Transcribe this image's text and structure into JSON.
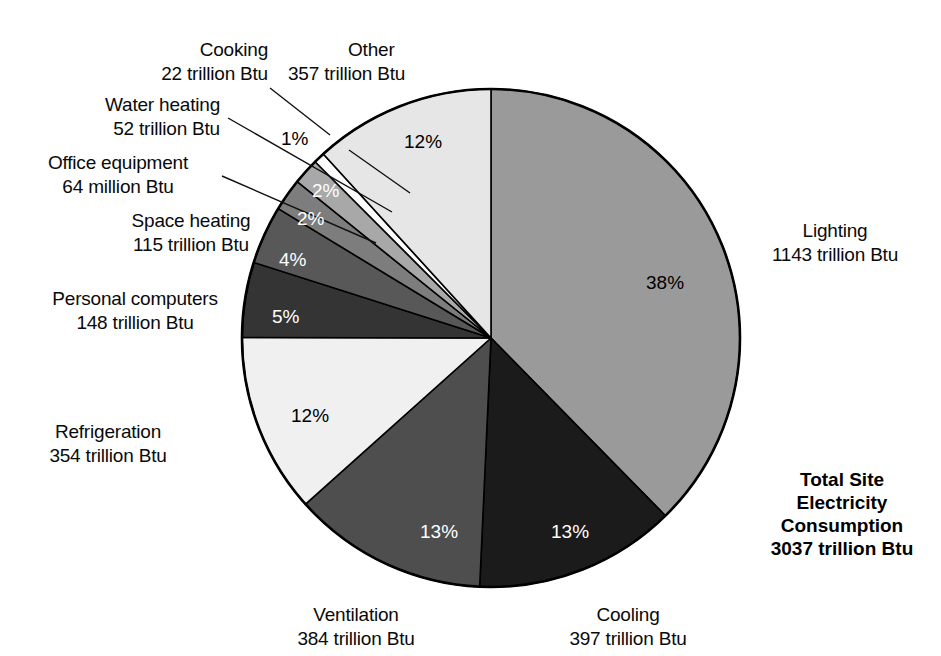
{
  "figure": {
    "background": "#ffffff",
    "total_label": {
      "lines": [
        "Total Site",
        "Electricity",
        "Consumption",
        "3037 trillion Btu"
      ]
    }
  },
  "chart_data": {
    "type": "pie",
    "title": "Total Site Electricity Consumption",
    "total_value": 3037,
    "total_unit": "trillion Btu",
    "xlabel": "",
    "ylabel": "",
    "legend": "none (direct labels with leader lines)",
    "start_angle_deg": 0,
    "direction": "clockwise",
    "categories": [
      "Lighting",
      "Cooling",
      "Ventilation",
      "Refrigeration",
      "Personal computers",
      "Space heating",
      "Office equipment",
      "Water heating",
      "Cooking",
      "Other"
    ],
    "values": [
      1143,
      397,
      384,
      354,
      148,
      115,
      64,
      52,
      22,
      357
    ],
    "percent_labels": [
      "38%",
      "13%",
      "13%",
      "12%",
      "5%",
      "4%",
      "2%",
      "2%",
      "1%",
      "12%"
    ],
    "slices": [
      {
        "name": "Lighting",
        "value": 1143,
        "value_text": "1143 trillion Btu",
        "unit": "trillion Btu",
        "percent": 38,
        "percent_label": "38%",
        "color": "#9a9a9a",
        "pct_text_color": "#000000",
        "label_lines": [
          "Lighting",
          "1143 trillion Btu"
        ]
      },
      {
        "name": "Cooling",
        "value": 397,
        "value_text": "397 trillion Btu",
        "unit": "trillion Btu",
        "percent": 13,
        "percent_label": "13%",
        "color": "#1b1b1b",
        "pct_text_color": "#ffffff",
        "label_lines": [
          "Cooling",
          "397 trillion Btu"
        ]
      },
      {
        "name": "Ventilation",
        "value": 384,
        "value_text": "384 trillion Btu",
        "unit": "trillion Btu",
        "percent": 13,
        "percent_label": "13%",
        "color": "#4e4e4e",
        "pct_text_color": "#ffffff",
        "label_lines": [
          "Ventilation",
          "384 trillion Btu"
        ]
      },
      {
        "name": "Refrigeration",
        "value": 354,
        "value_text": "354 trillion Btu",
        "unit": "trillion Btu",
        "percent": 12,
        "percent_label": "12%",
        "color": "#f0f0f0",
        "pct_text_color": "#000000",
        "label_lines": [
          "Refrigeration",
          "354 trillion Btu"
        ]
      },
      {
        "name": "Personal computers",
        "value": 148,
        "value_text": "148 trillion Btu",
        "unit": "trillion Btu",
        "percent": 5,
        "percent_label": "5%",
        "color": "#343434",
        "pct_text_color": "#ffffff",
        "label_lines": [
          "Personal computers",
          "148 trillion Btu"
        ]
      },
      {
        "name": "Space heating",
        "value": 115,
        "value_text": "115 trillion Btu",
        "unit": "trillion Btu",
        "percent": 4,
        "percent_label": "4%",
        "color": "#585858",
        "pct_text_color": "#ffffff",
        "label_lines": [
          "Space heating",
          "115 trillion Btu"
        ]
      },
      {
        "name": "Office equipment",
        "value": 64,
        "value_text": "64 million Btu",
        "unit": "million Btu",
        "percent": 2,
        "percent_label": "2%",
        "color": "#7d7d7d",
        "pct_text_color": "#ffffff",
        "label_lines": [
          "Office equipment",
          "64 million Btu"
        ]
      },
      {
        "name": "Water heating",
        "value": 52,
        "value_text": "52 trillion Btu",
        "unit": "trillion Btu",
        "percent": 2,
        "percent_label": "2%",
        "color": "#a8a8a8",
        "pct_text_color": "#ffffff",
        "label_lines": [
          "Water heating",
          "52 trillion Btu"
        ]
      },
      {
        "name": "Cooking",
        "value": 22,
        "value_text": "22 trillion Btu",
        "unit": "trillion Btu",
        "percent": 1,
        "percent_label": "1%",
        "color": "#fcfcfc",
        "pct_text_color": "#000000",
        "label_lines": [
          "Cooking",
          "22 trillion Btu"
        ]
      },
      {
        "name": "Other",
        "value": 357,
        "value_text": "357 trillion Btu",
        "unit": "trillion Btu",
        "percent": 12,
        "percent_label": "12%",
        "color": "#e6e6e6",
        "pct_text_color": "#000000",
        "label_lines": [
          "Other",
          "357 trillion Btu"
        ]
      }
    ]
  }
}
